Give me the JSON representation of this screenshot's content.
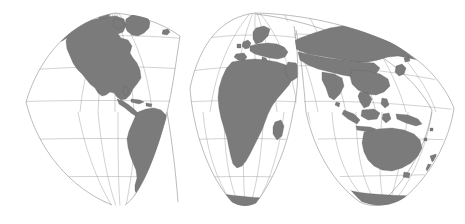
{
  "figure": {
    "title": "",
    "background_color": "#ffffff",
    "width": 465,
    "height": 224
  },
  "map": {
    "projection_name": "Goode Homolosine (interrupted)",
    "land_fill_color": "#7b7b7b",
    "land_stroke_color": "#5f5f5f",
    "graticule_color": "#9a9a9a",
    "outline_color": "#8e8e8e",
    "graticule_interval_degrees": 30,
    "parallels_labels": [
      "60N",
      "30N",
      "0",
      "30S",
      "60S"
    ],
    "meridians_labels": [
      "180W",
      "150W",
      "120W",
      "90W",
      "60W",
      "30W",
      "0",
      "30E",
      "60E",
      "90E",
      "120E",
      "150E",
      "180E"
    ],
    "lobe_count_north": 2,
    "lobe_count_south": 4,
    "lobes": [
      {
        "name": "north-america-lobe",
        "central_meridian": "100W"
      },
      {
        "name": "south-america-lobe",
        "central_meridian": "60W"
      },
      {
        "name": "europe-africa-lobe",
        "central_meridian": "20W"
      },
      {
        "name": "africa-south-lobe",
        "central_meridian": "20E"
      },
      {
        "name": "asia-lobe",
        "central_meridian": "60E"
      },
      {
        "name": "australia-lobe",
        "central_meridian": "140E"
      }
    ],
    "continents": [
      "North America",
      "South America",
      "Greenland",
      "Europe",
      "Africa",
      "Asia",
      "Australia",
      "New Zealand",
      "Antarctica",
      "Madagascar",
      "Japan",
      "Indonesia",
      "Philippines",
      "New Guinea",
      "British Isles",
      "Iceland",
      "Sri Lanka",
      "Cuba"
    ]
  }
}
